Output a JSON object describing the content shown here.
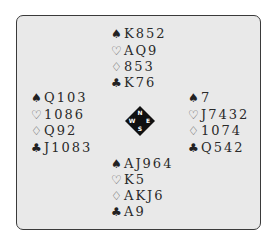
{
  "diagram": {
    "suits": [
      {
        "name": "spades",
        "glyph": "♠"
      },
      {
        "name": "hearts",
        "glyph": "♡"
      },
      {
        "name": "diamonds",
        "glyph": "♢"
      },
      {
        "name": "clubs",
        "glyph": "♣"
      }
    ],
    "hands": {
      "north": {
        "spades": "K852",
        "hearts": "AQ9",
        "diamonds": "853",
        "clubs": "K76"
      },
      "west": {
        "spades": "Q103",
        "hearts": "1086",
        "diamonds": "Q92",
        "clubs": "J1083"
      },
      "east": {
        "spades": "7",
        "hearts": "J7432",
        "diamonds": "1074",
        "clubs": "Q542"
      },
      "south": {
        "spades": "AJ964",
        "hearts": "K5",
        "diamonds": "AKJ6",
        "clubs": "A9"
      }
    },
    "compass": {
      "n": "N",
      "e": "E",
      "s": "S",
      "w": "W"
    }
  }
}
